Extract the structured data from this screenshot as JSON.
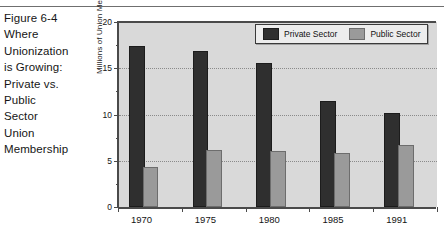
{
  "figure": {
    "caption_lines": [
      "Figure 6-4",
      "Where",
      "Unionization",
      "is Growing:",
      "Private vs.",
      "Public",
      "Sector",
      "Union",
      "Membership"
    ]
  },
  "chart_data": {
    "type": "bar",
    "title": "",
    "xlabel": "",
    "ylabel": "Millions of Union Members",
    "categories": [
      "1970",
      "1975",
      "1980",
      "1985",
      "1991"
    ],
    "series": [
      {
        "name": "Private Sector",
        "color": "#2f2f2f",
        "values": [
          17.2,
          16.6,
          15.4,
          11.2,
          9.9
        ]
      },
      {
        "name": "Public Sector",
        "color": "#9a9a9a",
        "values": [
          4.1,
          5.9,
          5.8,
          5.6,
          6.5
        ]
      }
    ],
    "ylim": [
      0,
      20
    ],
    "yticks": [
      0,
      5,
      10,
      15,
      20
    ],
    "ytick_labels": [
      "0",
      "5",
      "10",
      "15",
      "20"
    ],
    "yminor_ticks": [
      2.5,
      7.5,
      12.5,
      17.5
    ],
    "grid": "horizontal-dotted",
    "legend_position": "top-right",
    "plot_background": "#d9d9d9"
  }
}
